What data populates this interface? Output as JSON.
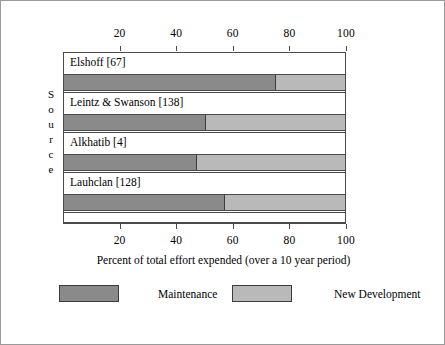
{
  "figure": {
    "border_color": "#9a9a9a",
    "background": "#ffffff"
  },
  "axis": {
    "y_title_letters": [
      "S",
      "o",
      "u",
      "r",
      "c",
      "e"
    ],
    "x_caption": "Percent of total effort expended (over a 10 year period)"
  },
  "legend": {
    "items": [
      {
        "label": "Maintenance",
        "color": "#8a8a8a"
      },
      {
        "label": "New Development",
        "color": "#b9b9b9"
      }
    ]
  },
  "chart_data": {
    "type": "bar",
    "orientation": "horizontal",
    "stacked": true,
    "title": "",
    "xlabel": "Percent of total effort expended (over a 10 year period)",
    "ylabel": "Source",
    "xlim": [
      0,
      100
    ],
    "xticks": [
      20,
      40,
      60,
      80,
      100
    ],
    "xtick_labels": [
      "20",
      "40",
      "60",
      "80",
      "100"
    ],
    "axis_positions": [
      "top",
      "bottom"
    ],
    "grid": false,
    "legend_position": "bottom",
    "categories": [
      "Elshoff [67]",
      "Leintz & Swanson [138]",
      "Alkhatib [4]",
      "Lauhclan [128]"
    ],
    "series": [
      {
        "name": "Maintenance",
        "color": "#8a8a8a",
        "values": [
          75,
          50,
          47,
          57
        ]
      },
      {
        "name": "New Development",
        "color": "#b9b9b9",
        "values": [
          25,
          50,
          53,
          43
        ]
      }
    ]
  }
}
